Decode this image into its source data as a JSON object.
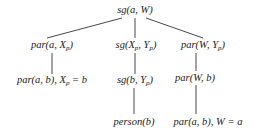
{
  "diagram": {
    "type": "tree",
    "nodes": [
      {
        "id": "root",
        "pre": "sg(a, W)",
        "x": 135,
        "y": 10
      },
      {
        "id": "n1",
        "pre": "par(a, X",
        "sub": "p",
        "post": ")",
        "x": 52,
        "y": 46
      },
      {
        "id": "n2",
        "pre": "sg(X",
        "sub": "p",
        "mid": ", Y",
        "sub2": "p",
        "post": ")",
        "x": 136,
        "y": 46
      },
      {
        "id": "n3",
        "pre": "par(W, Y",
        "sub": "p",
        "post": ")",
        "x": 203,
        "y": 46
      },
      {
        "id": "n1a",
        "pre": "par(a, b), X",
        "sub": "p",
        "post": " = b",
        "x": 52,
        "y": 81
      },
      {
        "id": "n2a",
        "pre": "sg(b, Y",
        "sub": "p",
        "post": ")",
        "x": 135,
        "y": 81
      },
      {
        "id": "n3a",
        "pre": "par(W, b)",
        "x": 195,
        "y": 78
      },
      {
        "id": "n2b",
        "pre": "person(b)",
        "x": 134,
        "y": 122
      },
      {
        "id": "n3b",
        "pre": "par(a, b), W = a",
        "x": 208,
        "y": 122
      }
    ],
    "edges": [
      {
        "from": "root",
        "to": "n1",
        "x1": 122,
        "y1": 18,
        "x2": 47,
        "y2": 38
      },
      {
        "from": "root",
        "to": "n2",
        "x1": 135,
        "y1": 18,
        "x2": 135,
        "y2": 38
      },
      {
        "from": "root",
        "to": "n3",
        "x1": 146,
        "y1": 18,
        "x2": 203,
        "y2": 38
      },
      {
        "from": "n1",
        "to": "n1a",
        "x1": 52,
        "y1": 53,
        "x2": 52,
        "y2": 74
      },
      {
        "from": "n2",
        "to": "n2a",
        "x1": 135,
        "y1": 53,
        "x2": 135,
        "y2": 74
      },
      {
        "from": "n3",
        "to": "n3a",
        "x1": 196,
        "y1": 53,
        "x2": 196,
        "y2": 71
      },
      {
        "from": "n2a",
        "to": "n2b",
        "x1": 134,
        "y1": 88,
        "x2": 134,
        "y2": 114
      },
      {
        "from": "n3a",
        "to": "n3b",
        "x1": 196,
        "y1": 85,
        "x2": 196,
        "y2": 114
      }
    ]
  }
}
